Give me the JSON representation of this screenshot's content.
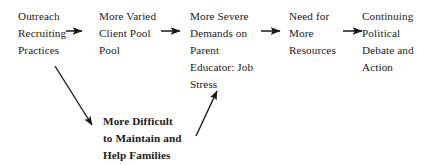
{
  "diagram": {
    "type": "flow-chart",
    "background_color": "#ffffff",
    "text_color": "#1a1a1a",
    "arrow_color": "#1a1a1a",
    "nodes": [
      {
        "id": "outreach-recruiting-practices",
        "lines": [
          "Outreach",
          "Recruiting",
          "Practices"
        ],
        "x": 18,
        "y": 8,
        "emphasis": false
      },
      {
        "id": "more-varied-client-pool",
        "lines": [
          "More Varied",
          "Client Pool",
          "Pool"
        ],
        "x": 99,
        "y": 8,
        "emphasis": false
      },
      {
        "id": "more-severe-demands-job-stress",
        "lines": [
          "More Severe",
          "Demands on",
          "Parent",
          "Educator: Job",
          "Stress"
        ],
        "x": 190,
        "y": 8,
        "emphasis": false
      },
      {
        "id": "need-for-more-resources",
        "lines": [
          "Need for",
          "More",
          "Resources"
        ],
        "x": 289,
        "y": 8,
        "emphasis": false
      },
      {
        "id": "continuing-political-debate",
        "lines": [
          "Continuing",
          "Political",
          "Debate and",
          "Action"
        ],
        "x": 362,
        "y": 8,
        "emphasis": false
      },
      {
        "id": "more-difficult-maintain-help-families",
        "lines": [
          "More Difficult",
          "to Maintain and",
          "Help Families"
        ],
        "x": 103,
        "y": 113,
        "emphasis": true
      }
    ],
    "arrows": [
      {
        "id": "arrow-outreach-to-client-pool",
        "from": "outreach-recruiting-practices",
        "to": "more-varied-client-pool",
        "orientation": "horizontal",
        "x1": 66,
        "y1": 31,
        "x2": 84,
        "y2": 31
      },
      {
        "id": "arrow-client-pool-to-demands",
        "from": "more-varied-client-pool",
        "to": "more-severe-demands-job-stress",
        "orientation": "horizontal",
        "x1": 161,
        "y1": 31,
        "x2": 182,
        "y2": 31
      },
      {
        "id": "arrow-demands-to-resources",
        "from": "more-severe-demands-job-stress",
        "to": "need-for-more-resources",
        "orientation": "horizontal",
        "x1": 261,
        "y1": 31,
        "x2": 282,
        "y2": 31
      },
      {
        "id": "arrow-resources-to-political-debate",
        "from": "need-for-more-resources",
        "to": "continuing-political-debate",
        "orientation": "horizontal",
        "x1": 343,
        "y1": 31,
        "x2": 364,
        "y2": 31
      },
      {
        "id": "arrow-outreach-to-more-difficult",
        "from": "outreach-recruiting-practices",
        "to": "more-difficult-maintain-help-families",
        "orientation": "diagonal-down-right",
        "x1": 55,
        "y1": 66,
        "x2": 95,
        "y2": 129
      },
      {
        "id": "arrow-more-difficult-to-demands",
        "from": "more-difficult-maintain-help-families",
        "to": "more-severe-demands-job-stress",
        "orientation": "diagonal-up-right",
        "x1": 196,
        "y1": 136,
        "x2": 219,
        "y2": 87
      }
    ]
  }
}
